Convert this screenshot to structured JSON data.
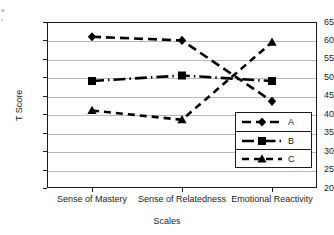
{
  "edge_text": {
    "line1": "a",
    "line2": "r"
  },
  "chart_data": {
    "type": "line",
    "title": "",
    "xlabel": "Scales",
    "ylabel": "T Score",
    "categories": [
      "Sense of Mastery",
      "Sense of Relatedness",
      "Emotional Reactivity"
    ],
    "ylim": [
      20,
      65
    ],
    "ytick_step": 5,
    "yticks": [
      65,
      60,
      55,
      50,
      45,
      40,
      35,
      30,
      25,
      20
    ],
    "grid": true,
    "legend_position": "inside-right",
    "series": [
      {
        "name": "A",
        "values": [
          61,
          60,
          43.5
        ],
        "marker": "diamond",
        "line_style": "solid",
        "color": "#000000"
      },
      {
        "name": "B",
        "values": [
          49,
          50.5,
          49
        ],
        "marker": "square",
        "line_style": "dash-dot",
        "color": "#000000"
      },
      {
        "name": "C",
        "values": [
          41,
          38.5,
          59.5
        ],
        "marker": "triangle",
        "line_style": "dashed",
        "color": "#000000"
      }
    ]
  }
}
